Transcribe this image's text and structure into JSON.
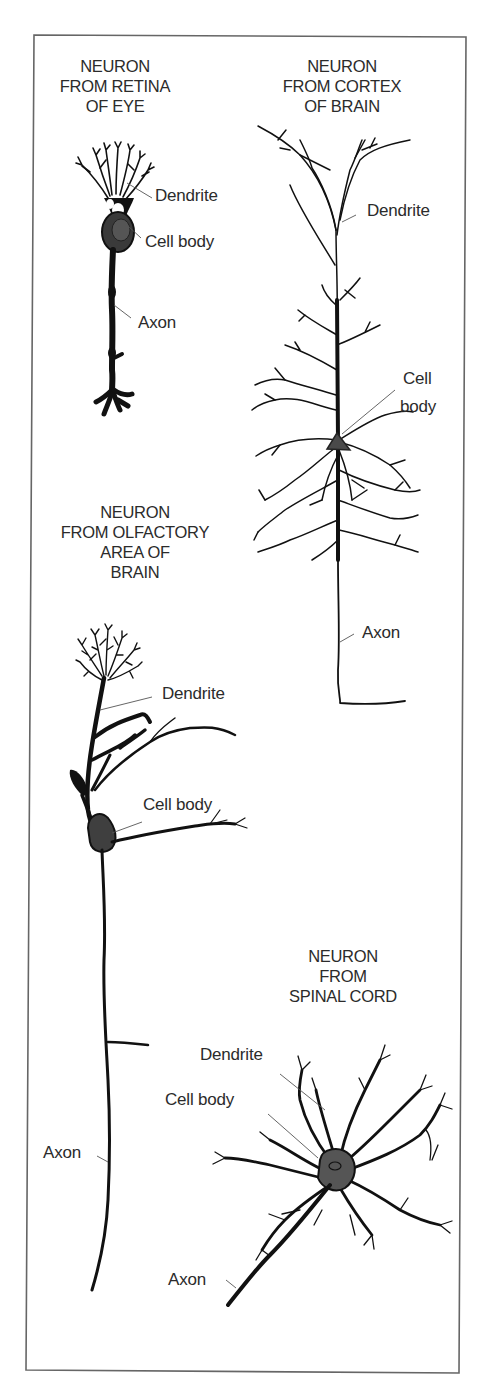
{
  "figure": {
    "frame_color": "#666666",
    "ink_color": "#111111",
    "cell_body_fill": "#4a4a4a"
  },
  "neurons": {
    "retina": {
      "title": [
        "NEURON",
        "FROM RETINA",
        "OF EYE"
      ],
      "labels": {
        "dendrite": "Dendrite",
        "cell_body": "Cell body",
        "axon": "Axon"
      }
    },
    "cortex": {
      "title": [
        "NEURON",
        "FROM CORTEX",
        "OF BRAIN"
      ],
      "labels": {
        "dendrite": "Dendrite",
        "cell_body_line1": "Cell",
        "cell_body_line2": "body",
        "axon": "Axon"
      }
    },
    "olfactory": {
      "title": [
        "NEURON",
        "FROM OLFACTORY",
        "AREA OF",
        "BRAIN"
      ],
      "labels": {
        "dendrite": "Dendrite",
        "cell_body": "Cell body",
        "axon": "Axon"
      }
    },
    "spinal": {
      "title": [
        "NEURON",
        "FROM",
        "SPINAL CORD"
      ],
      "labels": {
        "dendrite": "Dendrite",
        "cell_body": "Cell body",
        "axon": "Axon"
      }
    }
  }
}
